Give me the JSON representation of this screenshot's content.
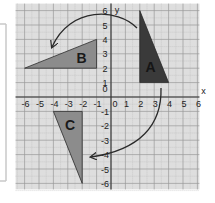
{
  "diagram": {
    "type": "coordinate-grid-rotation",
    "axes": {
      "x_label": "x",
      "y_label": "y",
      "x_ticks": [
        "-6",
        "-5",
        "-4",
        "-3",
        "-2",
        "-1",
        "0",
        "1",
        "2",
        "3",
        "4",
        "5",
        "6"
      ],
      "y_ticks": [
        "6",
        "5",
        "4",
        "3",
        "2",
        "1",
        "0",
        "-1",
        "-2",
        "-3",
        "-4",
        "-5",
        "-6"
      ],
      "range": {
        "xmin": -6,
        "xmax": 6,
        "ymin": -6,
        "ymax": 6
      }
    },
    "shapes": [
      {
        "label": "A",
        "vertices": [
          [
            2,
            6
          ],
          [
            2,
            1
          ],
          [
            4,
            1
          ]
        ],
        "fill": "#3a3a3a"
      },
      {
        "label": "B",
        "vertices": [
          [
            -6,
            2
          ],
          [
            -1,
            4
          ],
          [
            -1,
            2
          ]
        ],
        "fill": "#8c8c8c"
      },
      {
        "label": "C",
        "vertices": [
          [
            -4,
            -1
          ],
          [
            -2,
            -1
          ],
          [
            -2,
            -6
          ]
        ],
        "fill": "#8c8c8c"
      }
    ],
    "arrows": [
      {
        "from": "A",
        "to": "B",
        "direction": "counterclockwise"
      },
      {
        "from": "A",
        "to": "C",
        "direction": "clockwise"
      }
    ],
    "colors": {
      "grid_background": "#dedede",
      "grid_major": "#9a9a9a",
      "grid_minor": "#bdbdbd",
      "axis": "#333333",
      "shape_dark": "#3a3a3a",
      "shape_light": "#8c8c8c",
      "arrow": "#2a2a2a",
      "page_bracket": "#c8c8c8"
    }
  }
}
